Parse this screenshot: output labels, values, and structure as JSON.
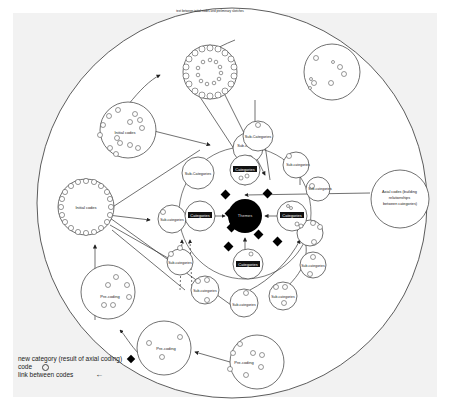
{
  "diagram": {
    "top_annotation": "text between initial codes and preliminary sketches",
    "center_node": {
      "label": "Themes"
    },
    "category_nodes": [
      {
        "id": "cat-top",
        "label": "Categories"
      },
      {
        "id": "cat-left",
        "label": "Categories"
      },
      {
        "id": "cat-right",
        "label": "Categories"
      },
      {
        "id": "cat-bottom",
        "label": "Categories"
      }
    ],
    "subcategory_nodes": [
      {
        "id": "sub-1",
        "label": "Sub-categories"
      },
      {
        "id": "sub-2",
        "label": "Sub-Categories"
      },
      {
        "id": "sub-3",
        "label": "Sub-Categories"
      },
      {
        "id": "sub-4",
        "label": "Sub-categories"
      },
      {
        "id": "sub-5",
        "label": "Sub-categories"
      },
      {
        "id": "sub-6",
        "label": "Sub-categories"
      },
      {
        "id": "sub-7",
        "label": "Sub-categories"
      },
      {
        "id": "sub-8",
        "label": "Sub-categories"
      },
      {
        "id": "sub-9",
        "label": "Sub-categories"
      },
      {
        "id": "sub-10",
        "label": "Sub-categories"
      },
      {
        "id": "sub-11",
        "label": "Sub-categories"
      }
    ],
    "initial_code_nodes": [
      {
        "id": "initial-upper",
        "label": "Initial codes"
      },
      {
        "id": "initial-left",
        "label": "Initial codes"
      }
    ],
    "precoding_nodes": [
      {
        "id": "pre-1",
        "label": "Pre-coding"
      },
      {
        "id": "pre-2",
        "label": "Pre-coding"
      },
      {
        "id": "pre-3",
        "label": "Pre-coding"
      }
    ],
    "axial_node": {
      "label": "Axial codes (building relationships between categories)"
    }
  },
  "legend": {
    "items": [
      {
        "label": "new category (result of axial coding)",
        "symbol": "diamond"
      },
      {
        "label": "code",
        "symbol": "circle"
      },
      {
        "label": "link between codes",
        "symbol": "arrow"
      }
    ]
  }
}
